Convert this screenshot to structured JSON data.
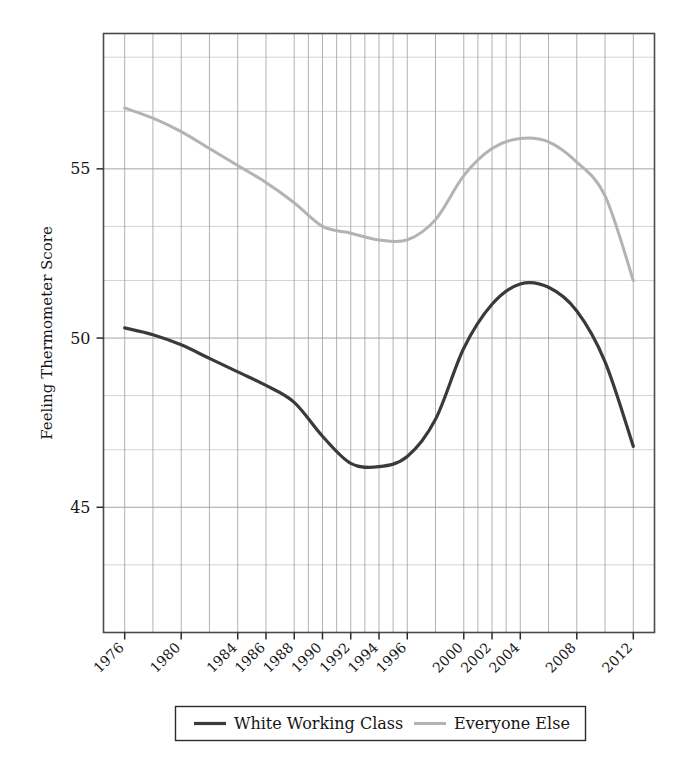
{
  "chart_data": {
    "type": "line",
    "title": "",
    "xlabel": "",
    "ylabel": "Feeling Thermometer Score",
    "xlim": [
      1974.5,
      2013.5
    ],
    "ylim": [
      41.3,
      59.0
    ],
    "yticks": [
      "45",
      "50",
      "55"
    ],
    "ytick_values": [
      45,
      50,
      55
    ],
    "xticks": [
      "1976",
      "1980",
      "1984",
      "1986",
      "1988",
      "1990",
      "1992",
      "1994",
      "1996",
      "2000",
      "2002",
      "2004",
      "2008",
      "2012"
    ],
    "xtick_values": [
      1976,
      1980,
      1984,
      1986,
      1988,
      1990,
      1992,
      1994,
      1996,
      2000,
      2002,
      2004,
      2008,
      2012
    ],
    "grid": true,
    "grid_x_values": [
      1976,
      1978,
      1980,
      1982,
      1984,
      1986,
      1988,
      1989,
      1990,
      1991,
      1992,
      1993,
      1994,
      1995,
      1996,
      1998,
      2000,
      2001,
      2002,
      2003,
      2004,
      2006,
      2008,
      2010,
      2012
    ],
    "grid_y_values": [
      43.3,
      45,
      46.7,
      48.3,
      50,
      51.7,
      53.3,
      55,
      56.7,
      58.3
    ],
    "legend_position": "bottom",
    "series": [
      {
        "name": "White Working Class",
        "color": "#3a3a3a",
        "width": 3.2,
        "x": [
          1976,
          1978,
          1980,
          1982,
          1984,
          1986,
          1988,
          1990,
          1992,
          1994,
          1996,
          1998,
          2000,
          2002,
          2004,
          2006,
          2008,
          2010,
          2012
        ],
        "y": [
          50.3,
          50.1,
          49.8,
          49.4,
          49.0,
          48.6,
          48.1,
          47.1,
          46.3,
          46.2,
          46.5,
          47.6,
          49.7,
          51.0,
          51.6,
          51.5,
          50.8,
          49.3,
          46.8
        ]
      },
      {
        "name": "Everyone Else",
        "color": "#b3b3b3",
        "width": 3.0,
        "x": [
          1976,
          1978,
          1980,
          1982,
          1984,
          1986,
          1988,
          1990,
          1992,
          1994,
          1996,
          1998,
          2000,
          2002,
          2004,
          2006,
          2008,
          2010,
          2012
        ],
        "y": [
          56.8,
          56.5,
          56.1,
          55.6,
          55.1,
          54.6,
          54.0,
          53.3,
          53.1,
          52.9,
          52.9,
          53.5,
          54.8,
          55.6,
          55.9,
          55.8,
          55.2,
          54.2,
          51.7
        ]
      }
    ]
  },
  "axis": {
    "ylabel": "Feeling Thermometer Score"
  },
  "legend": {
    "items": [
      {
        "label": "White Working Class"
      },
      {
        "label": "Everyone Else"
      }
    ]
  }
}
